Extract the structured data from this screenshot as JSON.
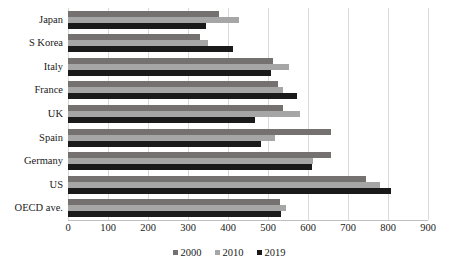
{
  "chart_data": {
    "type": "bar",
    "orientation": "horizontal",
    "title": "",
    "subtitle": "",
    "xlabel": "",
    "ylabel": "",
    "xlim": [
      0,
      900
    ],
    "xticks": [
      0,
      100,
      200,
      300,
      400,
      500,
      600,
      700,
      800,
      900
    ],
    "xtick_labels": [
      "0",
      "100",
      "200",
      "300",
      "400",
      "500",
      "600",
      "700",
      "800",
      "900"
    ],
    "grid": true,
    "legend_position": "bottom",
    "categories": [
      "Japan",
      "S Korea",
      "Italy",
      "France",
      "UK",
      "Spain",
      "Germany",
      "US",
      "OECD ave."
    ],
    "series": [
      {
        "name": "2000",
        "color": "#767171",
        "values": [
          378,
          330,
          513,
          525,
          538,
          658,
          658,
          745,
          530
        ]
      },
      {
        "name": "2010",
        "color": "#a6a6a6",
        "values": [
          428,
          350,
          553,
          538,
          580,
          518,
          613,
          780,
          545
        ]
      },
      {
        "name": "2019",
        "color": "#1a1a1a",
        "values": [
          345,
          413,
          508,
          573,
          468,
          483,
          610,
          808,
          533
        ]
      }
    ]
  },
  "legend": {
    "items": [
      {
        "label": "2000",
        "color": "#767171"
      },
      {
        "label": "2010",
        "color": "#a6a6a6"
      },
      {
        "label": "2019",
        "color": "#1a1a1a"
      }
    ]
  }
}
